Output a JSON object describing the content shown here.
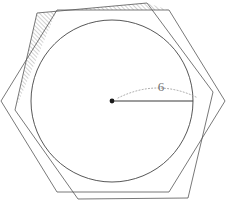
{
  "figure": {
    "radius_label": "6",
    "colors": {
      "stroke": "#555555",
      "circle_stroke": "#444444",
      "radius_stroke": "#3a3a3a",
      "arc_stroke": "#9a9a9a",
      "hatch_stroke": "#7d7d7d",
      "label_fill": "#6e6e6e",
      "background": "#ffffff"
    },
    "circle": {
      "cx": 112,
      "cy": 101,
      "r": 81
    },
    "center_point": {
      "cx": 112,
      "cy": 101,
      "r": 2.4
    },
    "radius_line": {
      "x1": 112,
      "y1": 101,
      "x2": 193,
      "y2": 101
    },
    "radius_arc": {
      "d": "M 118 98 Q 158 78 198 98"
    },
    "radius_label_pos": {
      "x": 161,
      "y": 91
    },
    "hexagon_main": {
      "points": "57,10 169,10 225,101 169,192 57,192 1,101"
    },
    "hexagon_rotated": {
      "points": "37,13 147,3 213,92 188,198 78,199 15,110"
    },
    "hatched_region": {
      "points": "57,10 169,10 147,3 37,13 16,108 30,105"
    },
    "hatch_pattern": {
      "angle": 45,
      "spacing": 3,
      "line_width": 0.7
    }
  }
}
